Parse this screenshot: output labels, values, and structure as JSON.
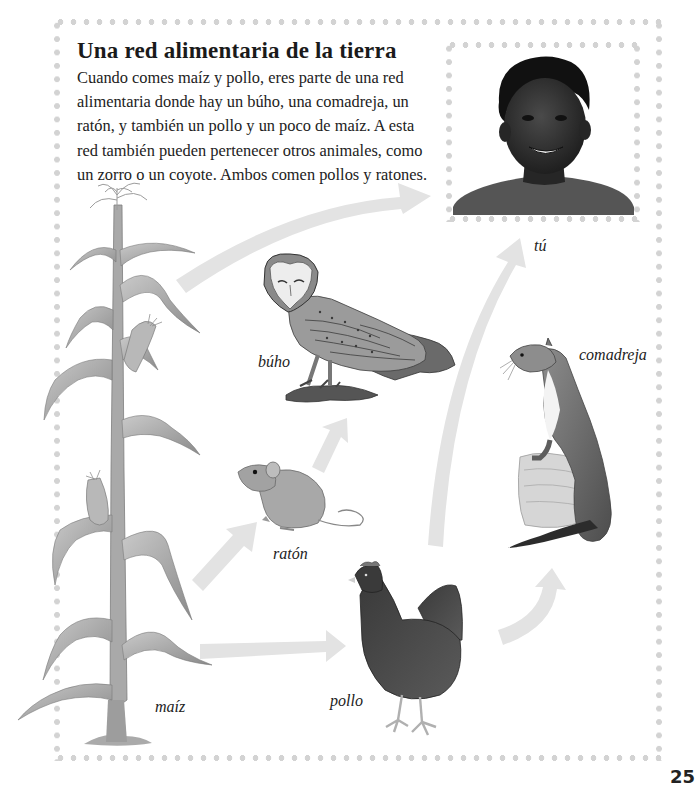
{
  "title": "Una red alimentaria de la tierra",
  "intro": "Cuando comes maíz y pollo, eres parte de una red alimentaria donde hay un búho, una comadreja, un ratón, y también un pollo y un poco de maíz. A esta red también pueden pertenecer otros animales, como un zorro o un coyote. Ambos comen pollos y ratones.",
  "organisms": {
    "corn": "maíz",
    "owl": "búho",
    "mouse": "ratón",
    "chicken": "pollo",
    "weasel": "comadreja",
    "you": "tú"
  },
  "arrows": [
    {
      "from": "maíz",
      "to": "tú"
    },
    {
      "from": "maíz",
      "to": "ratón"
    },
    {
      "from": "maíz",
      "to": "pollo"
    },
    {
      "from": "ratón",
      "to": "búho"
    },
    {
      "from": "pollo",
      "to": "tú"
    },
    {
      "from": "pollo",
      "to": "comadreja"
    }
  ],
  "colors": {
    "arrow": "#e3e3e3",
    "dots": "#d3d3d3",
    "text": "#1a1a1a"
  },
  "page_number": "25"
}
